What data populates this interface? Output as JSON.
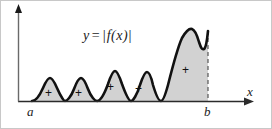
{
  "figure": {
    "equation": {
      "lhs": "y",
      "operator": "=",
      "bar_left": "|",
      "function": "f(x)",
      "bar_right": "|",
      "full_text": "y = |f(x)|"
    },
    "axes": {
      "x_axis_label": "x",
      "y_axis_present": true,
      "x_axis_arrow": true,
      "y_axis_arrow": true,
      "baseline_y": 100,
      "axis_color": "#2b2b2b"
    },
    "endpoints": {
      "left_label": "a",
      "right_label": "b",
      "left_x": 31,
      "right_x": 207,
      "dashed_line_at_b": true
    },
    "style": {
      "fill_color": "#d2d2d2",
      "curve_color": "#111111",
      "border_color": "#c8c8c8",
      "background": "#ffffff",
      "curve_width": 2.6
    },
    "regions": [
      {
        "sign": "+",
        "cx": 48,
        "cy": 92
      },
      {
        "sign": "+",
        "cx": 78,
        "cy": 92
      },
      {
        "sign": "+",
        "cx": 110,
        "cy": 86
      },
      {
        "sign": "+",
        "cx": 138,
        "cy": 88
      },
      {
        "sign": "+",
        "cx": 185,
        "cy": 69
      }
    ],
    "curve_path": "M 31 100 C 34 100 38 96 42 87 C 45 80 47 77 49 77 C 51 77 53 80 56 87 C 60 96 63 100 64 100 C 66 100 70 96 73 88 C 76 80 78 77 80 77 C 82 77 84 80 87 88 C 90 96 94 100 96 100 C 99 100 103 94 107 83 C 110 74 112 70 114 70 C 116 70 118 74 121 83 C 125 94 128 100 130 100 C 132 100 136 94 139 84 C 142 75 144 71 146 71 C 148 71 150 75 152 84 C 155 94 158 100 160 100 C 162 100 164 95 167 84 C 171 68 176 48 181 37 C 185 30 188 27 191 28 C 194 29 196 34 198 41 C 200 47 201 49 203 48 C 205 47 206 40 207 30",
    "zero_touch_points": [
      31,
      64,
      96,
      130,
      160
    ]
  }
}
